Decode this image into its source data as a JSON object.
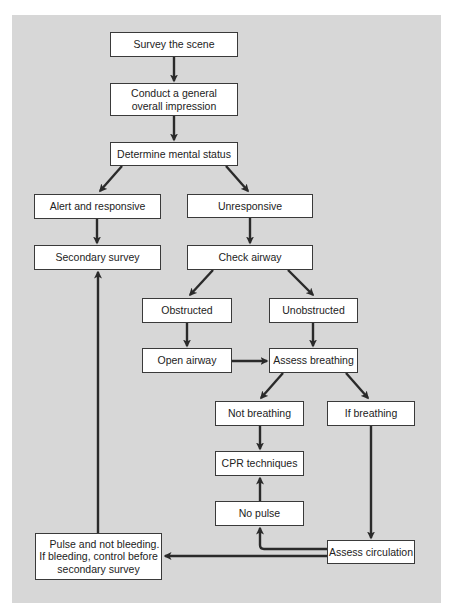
{
  "diagram": {
    "type": "flowchart",
    "background_color": "#d7d7d7",
    "box_color": "#ffffff",
    "line_color": "#2a2a2a",
    "nodes": {
      "survey_scene": "Survey the scene",
      "general_impression_line1": "Conduct a general",
      "general_impression_line2": "overall impression",
      "mental_status": "Determine mental status",
      "alert_responsive": "Alert and responsive",
      "unresponsive": "Unresponsive",
      "secondary_survey": "Secondary survey",
      "check_airway": "Check airway",
      "obstructed": "Obstructed",
      "unobstructed": "Unobstructed",
      "open_airway": "Open airway",
      "assess_breathing": "Assess breathing",
      "not_breathing": "Not breathing",
      "if_breathing": "If breathing",
      "cpr_techniques": "CPR techniques",
      "no_pulse": "No pulse",
      "assess_circulation": "Assess circulation",
      "pulse_line1": "Pulse and not bleeding.",
      "pulse_line2": "If bleeding, control before",
      "pulse_line3": "secondary survey"
    },
    "edges": [
      [
        "Survey the scene",
        "Conduct a general overall impression"
      ],
      [
        "Conduct a general overall impression",
        "Determine mental status"
      ],
      [
        "Determine mental status",
        "Alert and responsive"
      ],
      [
        "Determine mental status",
        "Unresponsive"
      ],
      [
        "Alert and responsive",
        "Secondary survey"
      ],
      [
        "Unresponsive",
        "Check airway"
      ],
      [
        "Check airway",
        "Obstructed"
      ],
      [
        "Check airway",
        "Unobstructed"
      ],
      [
        "Obstructed",
        "Open airway"
      ],
      [
        "Unobstructed",
        "Assess breathing"
      ],
      [
        "Open airway",
        "Assess breathing"
      ],
      [
        "Assess breathing",
        "Not breathing"
      ],
      [
        "Assess breathing",
        "If breathing"
      ],
      [
        "Not breathing",
        "CPR techniques"
      ],
      [
        "If breathing",
        "Assess circulation"
      ],
      [
        "Assess circulation",
        "No pulse"
      ],
      [
        "No pulse",
        "CPR techniques"
      ],
      [
        "Assess circulation",
        "Pulse and not bleeding. If bleeding, control before secondary survey"
      ],
      [
        "Pulse and not bleeding. If bleeding, control before secondary survey",
        "Secondary survey"
      ]
    ]
  }
}
